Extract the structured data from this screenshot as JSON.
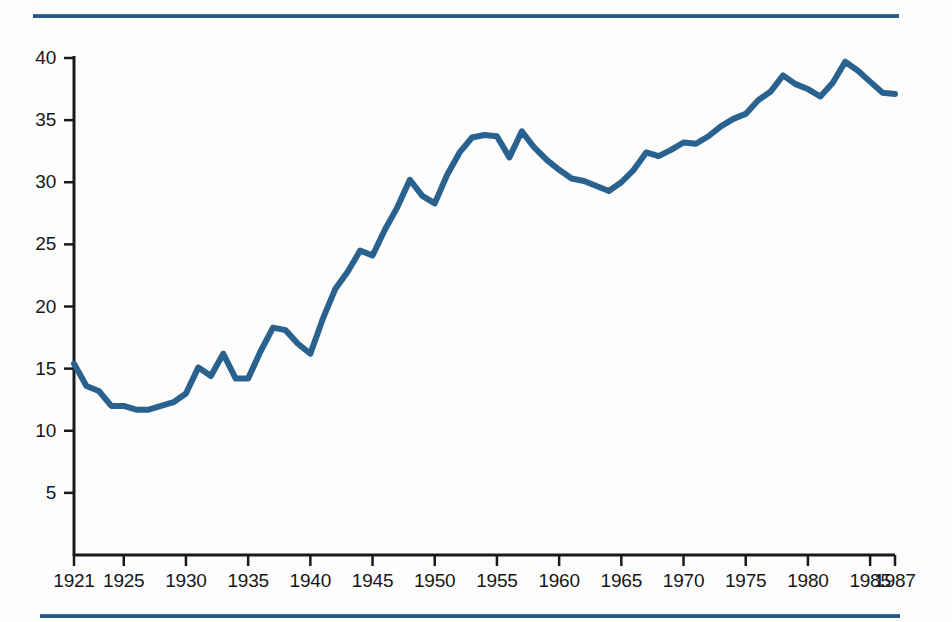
{
  "figure": {
    "title": "",
    "rule_color": "#1d4f7c",
    "line_color": "#2a628f",
    "axis_color": "#1a1a1a",
    "background": "#ffffff"
  },
  "axes": {
    "y_ticks": [
      "5",
      "10",
      "15",
      "20",
      "25",
      "30",
      "35",
      "40"
    ],
    "x_ticks": [
      "1921",
      "1925",
      "1930",
      "1935",
      "1940",
      "1945",
      "1950",
      "1955",
      "1960",
      "1965",
      "1970",
      "1975",
      "1980",
      "1985",
      "1987"
    ]
  },
  "chart_data": {
    "type": "line",
    "title": "",
    "subtitle": "",
    "xlabel": "",
    "ylabel": "",
    "xlim": [
      1921,
      1987
    ],
    "ylim": [
      0,
      41
    ],
    "grid": false,
    "legend": "none",
    "x_tick_values": [
      1921,
      1925,
      1930,
      1935,
      1940,
      1945,
      1950,
      1955,
      1960,
      1965,
      1970,
      1975,
      1980,
      1985,
      1987
    ],
    "y_tick_values": [
      5,
      10,
      15,
      20,
      25,
      30,
      35,
      40
    ],
    "x": [
      1921,
      1922,
      1923,
      1924,
      1925,
      1926,
      1927,
      1928,
      1929,
      1930,
      1931,
      1932,
      1933,
      1934,
      1935,
      1936,
      1937,
      1938,
      1939,
      1940,
      1941,
      1942,
      1943,
      1944,
      1945,
      1946,
      1947,
      1948,
      1949,
      1950,
      1951,
      1952,
      1953,
      1954,
      1955,
      1956,
      1957,
      1958,
      1959,
      1960,
      1961,
      1962,
      1963,
      1964,
      1965,
      1966,
      1967,
      1968,
      1969,
      1970,
      1971,
      1972,
      1973,
      1974,
      1975,
      1976,
      1977,
      1978,
      1979,
      1980,
      1981,
      1982,
      1983,
      1984,
      1985,
      1986,
      1987
    ],
    "series": [
      {
        "name": "value",
        "values": [
          15.4,
          13.6,
          13.2,
          12.0,
          12.0,
          11.7,
          11.7,
          12.0,
          12.3,
          13.0,
          15.1,
          14.4,
          16.2,
          14.2,
          14.2,
          16.4,
          18.3,
          18.1,
          17.0,
          16.2,
          19.0,
          21.4,
          22.8,
          24.5,
          24.1,
          26.2,
          28.0,
          30.2,
          28.9,
          28.3,
          30.6,
          32.4,
          33.6,
          33.8,
          33.7,
          32.0,
          34.1,
          32.8,
          31.8,
          31.0,
          30.3,
          30.1,
          29.7,
          29.3,
          30.0,
          31.0,
          32.4,
          32.1,
          32.6,
          33.2,
          33.1,
          33.7,
          34.5,
          35.1,
          35.5,
          36.6,
          37.3,
          38.6,
          37.9,
          37.5,
          36.9,
          38.0,
          39.7,
          39.0,
          38.1,
          37.2,
          37.1
        ]
      }
    ]
  }
}
